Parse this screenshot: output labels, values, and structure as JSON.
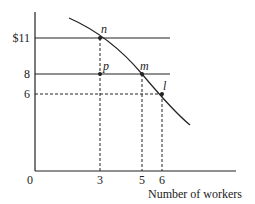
{
  "diagram": {
    "type": "labor-demand-graph",
    "y_axis": {
      "tick_labels": [
        "$11",
        "8",
        "6"
      ]
    },
    "x_axis": {
      "origin_label": "0",
      "tick_labels": [
        "3",
        "5",
        "6"
      ],
      "title": "Number of workers"
    },
    "points": [
      {
        "label": "n",
        "x": 3,
        "y": 11
      },
      {
        "label": "p",
        "x": 3,
        "y": 8
      },
      {
        "label": "m",
        "x": 5,
        "y": 8
      },
      {
        "label": "l",
        "x": 6,
        "y": 6
      }
    ],
    "lines": [
      {
        "name": "wage-11-line",
        "y": 11,
        "style": "solid"
      },
      {
        "name": "wage-8-line",
        "y": 8,
        "style": "solid"
      },
      {
        "name": "wage-6-guide",
        "y": 6,
        "style": "dashed"
      }
    ],
    "curve": {
      "name": "demand-curve",
      "style": "solid"
    },
    "colors": {
      "ink": "#222222",
      "background": "#ffffff"
    }
  }
}
